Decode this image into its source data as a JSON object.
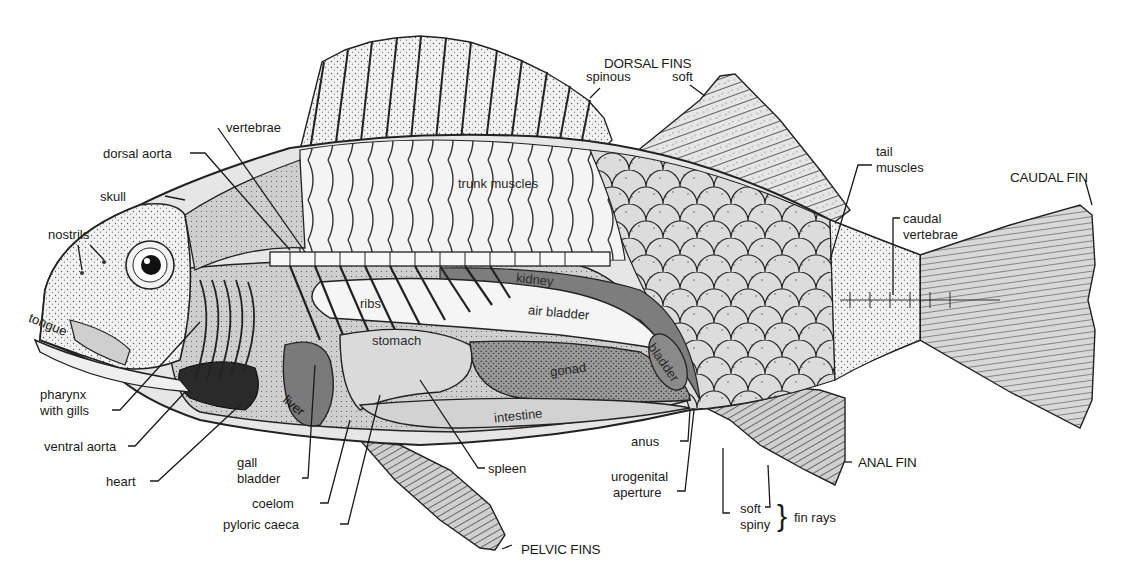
{
  "diagram": {
    "fin_headings": {
      "dorsal_fins": "DORSAL FINS",
      "caudal_fin": "CAUDAL FIN",
      "anal_fin": "ANAL FIN",
      "pelvic_fins": "PELVIC FINS"
    },
    "labels": {
      "spinous": "spinous",
      "soft_dorsal": "soft",
      "vertebrae": "vertebrae",
      "dorsal_aorta": "dorsal aorta",
      "skull": "skull",
      "nostrils": "nostrils",
      "tongue": "tongue",
      "trunk_muscles": "trunk muscles",
      "tail": "tail",
      "muscles": "muscles",
      "caudal": "caudal",
      "caudal_vertebrae_2": "vertebrae",
      "kidney": "kidney",
      "ribs": "ribs",
      "air_bladder": "air bladder",
      "stomach": "stomach",
      "gonad": "gonad",
      "bladder": "bladder",
      "liver": "liver",
      "intestine": "intestine",
      "pharynx": "pharynx",
      "with_gills": "with gills",
      "ventral_aorta": "ventral aorta",
      "heart": "heart",
      "gall": "gall",
      "gall_bladder_2": "bladder",
      "coelom": "coelom",
      "pyloric_caeca": "pyloric caeca",
      "spleen": "spleen",
      "anus": "anus",
      "urogenital": "urogenital",
      "aperture": "aperture",
      "soft_rays": "soft",
      "spiny_rays": "spiny",
      "fin_rays": "fin rays",
      "brace": "}"
    },
    "colors": {
      "ink": "#1a1a1a",
      "body_fill": "#e4e4e4",
      "organ_dark": "#8a8a8a",
      "organ_mid": "#b8b8b8",
      "organ_light": "#d6d6d6",
      "background": "#ffffff"
    }
  }
}
